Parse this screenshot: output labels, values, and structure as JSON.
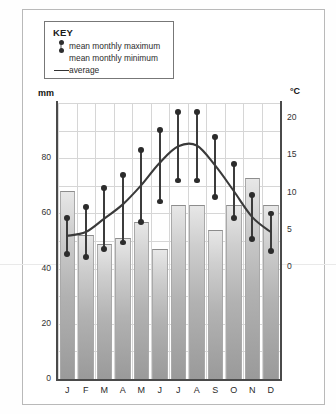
{
  "legend": {
    "title": "KEY",
    "items": [
      {
        "symbol": "max-min-marker",
        "label": "mean monthly maximum"
      },
      {
        "symbol": "max-min-marker",
        "label": "mean monthly minimum"
      },
      {
        "symbol": "line",
        "label": "average"
      }
    ]
  },
  "axes": {
    "left_unit": "mm",
    "right_unit": "°C",
    "left_ticks": [
      "0",
      "20",
      "40",
      "60",
      "80"
    ],
    "right_ticks": [
      "0",
      "5",
      "10",
      "15",
      "20"
    ]
  },
  "chart_data": {
    "type": "bar",
    "title": "",
    "xlabel": "",
    "ylabel": "mm",
    "categories": [
      "J",
      "F",
      "M",
      "A",
      "M",
      "J",
      "J",
      "A",
      "S",
      "O",
      "N",
      "D"
    ],
    "series": [
      {
        "name": "precipitation",
        "unit": "mm",
        "axis": "left",
        "type": "bar",
        "values": [
          68,
          52,
          49,
          51,
          57,
          47,
          63,
          63,
          54,
          63,
          73,
          63
        ]
      },
      {
        "name": "mean monthly maximum",
        "unit": "°C",
        "axis": "right",
        "type": "point",
        "values": [
          6.6,
          8.1,
          10.6,
          12.4,
          15.7,
          18.4,
          20.8,
          20.8,
          17.4,
          13.8,
          9.7,
          7.2
        ]
      },
      {
        "name": "mean monthly minimum",
        "unit": "°C",
        "axis": "right",
        "type": "point",
        "values": [
          1.8,
          1.3,
          2.4,
          3.3,
          6.0,
          8.8,
          11.6,
          11.6,
          9.4,
          6.6,
          3.8,
          2.2
        ]
      },
      {
        "name": "average",
        "unit": "°C",
        "axis": "right",
        "type": "line",
        "values": [
          4.2,
          4.7,
          6.5,
          8.4,
          11.0,
          14.0,
          16.2,
          16.3,
          13.6,
          10.2,
          6.7,
          4.7
        ]
      }
    ],
    "left_axis": {
      "label": "mm",
      "min": 0,
      "max": 100,
      "ticks": [
        0,
        20,
        40,
        60,
        80
      ]
    },
    "right_axis": {
      "label": "°C",
      "min": -15,
      "max": 22,
      "ticks": [
        0,
        5,
        10,
        15,
        20
      ]
    },
    "grid": true,
    "legend_position": "top-left"
  }
}
